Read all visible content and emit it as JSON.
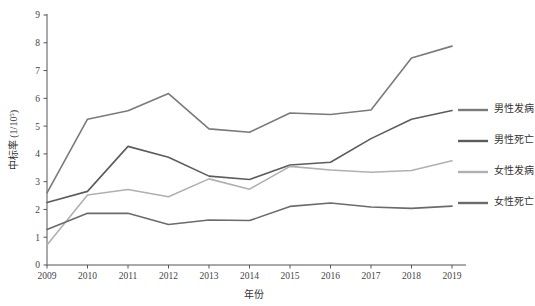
{
  "chart_data": {
    "type": "line",
    "title": "",
    "subtitle": "",
    "xlabel": "年份",
    "ylabel": "中标率 (1/10",
    "ylabel_sup": "5",
    "ylabel_tail": ")",
    "x": [
      "2009",
      "2010",
      "2011",
      "2012",
      "2013",
      "2014",
      "2015",
      "2016",
      "2017",
      "2018",
      "2019"
    ],
    "categories": [
      "2009",
      "2010",
      "2011",
      "2012",
      "2013",
      "2014",
      "2015",
      "2016",
      "2017",
      "2018",
      "2019"
    ],
    "xlim": [
      2009,
      2019
    ],
    "ylim": [
      0,
      9
    ],
    "yticks": [
      "0",
      "1",
      "2",
      "3",
      "4",
      "5",
      "6",
      "7",
      "8",
      "9"
    ],
    "ytick_values": [
      0,
      1,
      2,
      3,
      4,
      5,
      6,
      7,
      8,
      9
    ],
    "grid": false,
    "legend_position": "right",
    "series": [
      {
        "name": "男性发病",
        "color": "#7a7a7a",
        "values": [
          2.6,
          5.25,
          5.55,
          6.17,
          4.9,
          4.78,
          5.47,
          5.42,
          5.58,
          7.45,
          7.88
        ]
      },
      {
        "name": "男性死亡",
        "color": "#5c5c5c",
        "values": [
          2.25,
          2.65,
          4.27,
          3.88,
          3.2,
          3.08,
          3.6,
          3.7,
          4.55,
          5.25,
          5.56
        ]
      },
      {
        "name": "女性发病",
        "color": "#b0b0b0",
        "values": [
          0.72,
          2.52,
          2.72,
          2.46,
          3.1,
          2.73,
          3.55,
          3.42,
          3.34,
          3.4,
          3.75
        ]
      },
      {
        "name": "女性死亡",
        "color": "#6b6b6b",
        "values": [
          1.28,
          1.86,
          1.86,
          1.46,
          1.62,
          1.6,
          2.11,
          2.23,
          2.09,
          2.04,
          2.12
        ]
      }
    ],
    "legend": [
      {
        "label": "男性发病",
        "color": "#7a7a7a"
      },
      {
        "label": "男性死亡",
        "color": "#5c5c5c"
      },
      {
        "label": "女性发病",
        "color": "#b0b0b0"
      },
      {
        "label": "女性死亡",
        "color": "#6b6b6b"
      }
    ]
  }
}
